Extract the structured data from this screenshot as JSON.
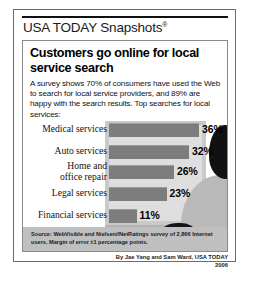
{
  "masthead": {
    "brand": "USA TODAY Snapshots",
    "registered_mark": "®"
  },
  "headline": "Customers go online\nfor local service search",
  "deck": "A survey shows 70% of consumers have used the Web to search for local service providers, and 89% are happy with the search results. Top searches for local services:",
  "note": "Note: Multiple\nresponses allowed",
  "source": "Source: WebVisible and Nielsen//NetRatings survey of 2,866 Internet users. Margin of error ±1 percentage points.",
  "byline": {
    "credit": "By Jae Yang and Sam Ward, USA TODAY",
    "year": "2006"
  },
  "colors": {
    "bar_fill": "#7d7d7d",
    "screen": "#dedede",
    "monitor": "#c9c9c9",
    "source_band": "#bfbfbf",
    "silhouette": "#111111"
  },
  "chart_data": {
    "type": "bar",
    "orientation": "horizontal",
    "title": "Customers go online for local service search",
    "xlabel": "",
    "ylabel": "",
    "xlim": [
      0,
      40
    ],
    "grid": false,
    "legend": null,
    "value_suffix": "%",
    "categories": [
      "Medical services",
      "Auto services",
      "Home and\noffice repair",
      "Legal services",
      "Financial services"
    ],
    "values": [
      36,
      32,
      26,
      23,
      11
    ],
    "labels": [
      "36%",
      "32%",
      "26%",
      "23%",
      "11%"
    ],
    "annotations": [
      "Note: Multiple responses allowed"
    ]
  }
}
